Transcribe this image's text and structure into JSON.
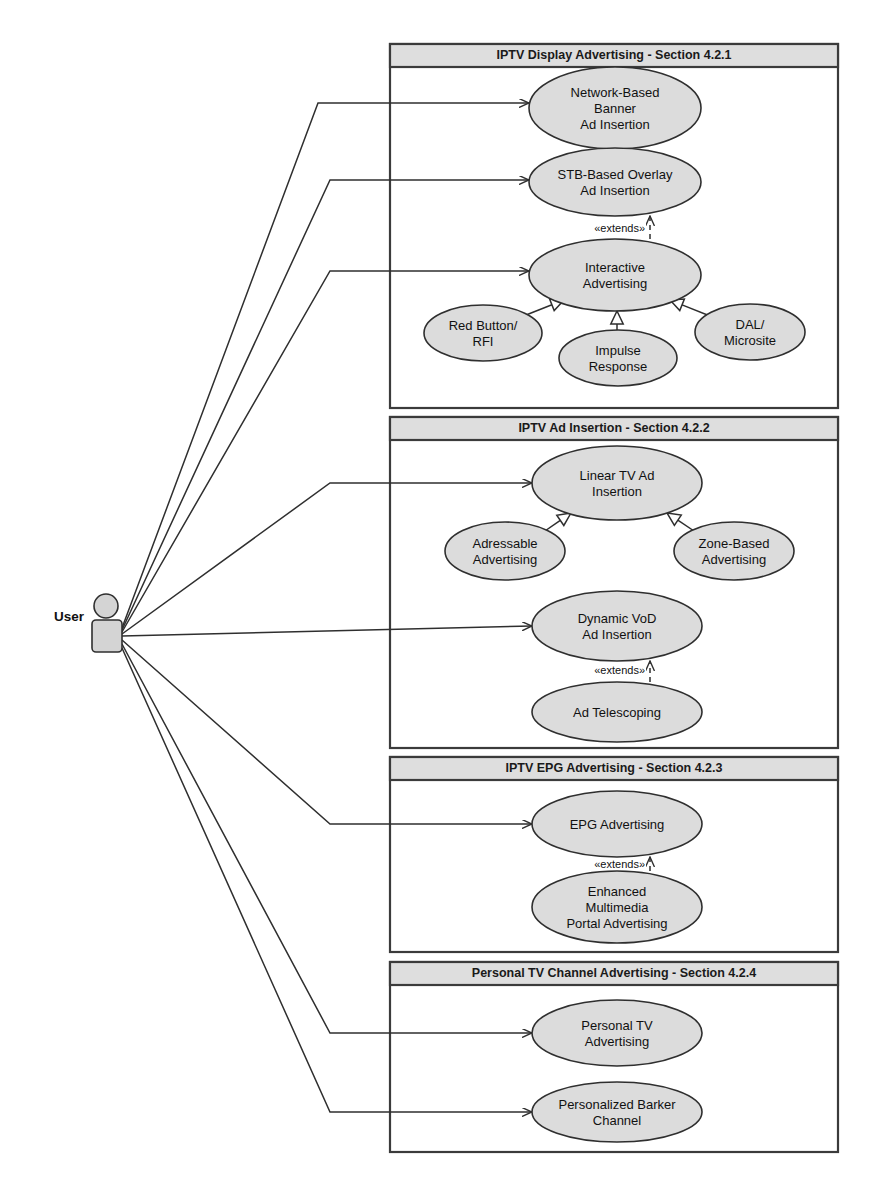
{
  "diagram": {
    "type": "uml-use-case-diagram",
    "canvas": {
      "width": 884,
      "height": 1201
    },
    "colors": {
      "ellipse_fill": "#dcdcdc",
      "ellipse_stroke": "#2f2f2f",
      "frame_header_fill": "#dedede",
      "frame_stroke": "#3b3b3b",
      "actor_fill": "#d4d4d4",
      "background": "#ffffff"
    },
    "actor": {
      "name": "User",
      "label": "User",
      "head": {
        "cx": 106,
        "cy": 606,
        "r": 12
      },
      "body": {
        "x": 92,
        "y": 620,
        "width": 30,
        "height": 32,
        "rx": 4
      },
      "label_pos": {
        "x": 84,
        "y": 617
      },
      "anchor": {
        "x": 122,
        "y": 636
      }
    },
    "stereotype_extends": "«extends»",
    "frames": [
      {
        "id": "frame-421",
        "title": "IPTV Display Advertising - Section 4.2.1",
        "x": 390,
        "y": 44,
        "width": 448,
        "height": 364,
        "header_height": 23
      },
      {
        "id": "frame-422",
        "title": "IPTV Ad Insertion - Section 4.2.2",
        "x": 390,
        "y": 417,
        "width": 448,
        "height": 331,
        "header_height": 23
      },
      {
        "id": "frame-423",
        "title": "IPTV EPG Advertising - Section 4.2.3",
        "x": 390,
        "y": 757,
        "width": 448,
        "height": 195,
        "header_height": 23
      },
      {
        "id": "frame-424",
        "title": "Personal TV Channel Advertising - Section 4.2.4",
        "x": 390,
        "y": 962,
        "width": 448,
        "height": 190,
        "header_height": 23
      }
    ],
    "use_cases": [
      {
        "id": "uc-network-banner",
        "name": "network-based-banner-ad-insertion",
        "lines": [
          "Network-Based",
          "Banner",
          "Ad Insertion"
        ],
        "cx": 615,
        "cy": 108,
        "rx": 86,
        "ry": 41,
        "frame": "frame-421"
      },
      {
        "id": "uc-stb-overlay",
        "name": "stb-based-overlay-ad-insertion",
        "lines": [
          "STB-Based Overlay",
          "Ad Insertion"
        ],
        "cx": 615,
        "cy": 182,
        "rx": 86,
        "ry": 34,
        "frame": "frame-421"
      },
      {
        "id": "uc-interactive",
        "name": "interactive-advertising",
        "lines": [
          "Interactive",
          "Advertising"
        ],
        "cx": 615,
        "cy": 275,
        "rx": 86,
        "ry": 36,
        "frame": "frame-421"
      },
      {
        "id": "uc-red-button",
        "name": "red-button-rfi",
        "lines": [
          "Red Button/",
          "RFI"
        ],
        "cx": 483,
        "cy": 333,
        "rx": 59,
        "ry": 28,
        "frame": "frame-421"
      },
      {
        "id": "uc-impulse",
        "name": "impulse-response",
        "lines": [
          "Impulse",
          "Response"
        ],
        "cx": 618,
        "cy": 358,
        "rx": 59,
        "ry": 28,
        "frame": "frame-421"
      },
      {
        "id": "uc-dal-microsite",
        "name": "dal-microsite",
        "lines": [
          "DAL/",
          "Microsite"
        ],
        "cx": 750,
        "cy": 332,
        "rx": 55,
        "ry": 28,
        "frame": "frame-421"
      },
      {
        "id": "uc-linear-tv",
        "name": "linear-tv-ad-insertion",
        "lines": [
          "Linear TV Ad",
          "Insertion"
        ],
        "cx": 617,
        "cy": 483,
        "rx": 85,
        "ry": 37,
        "frame": "frame-422"
      },
      {
        "id": "uc-addressable",
        "name": "adressable-advertising",
        "lines": [
          "Adressable",
          "Advertising"
        ],
        "cx": 505,
        "cy": 551,
        "rx": 60,
        "ry": 29,
        "frame": "frame-422"
      },
      {
        "id": "uc-zone-based",
        "name": "zone-based-advertising",
        "lines": [
          "Zone-Based",
          "Advertising"
        ],
        "cx": 734,
        "cy": 551,
        "rx": 60,
        "ry": 29,
        "frame": "frame-422"
      },
      {
        "id": "uc-dynamic-vod",
        "name": "dynamic-vod-ad-insertion",
        "lines": [
          "Dynamic VoD",
          "Ad Insertion"
        ],
        "cx": 617,
        "cy": 626,
        "rx": 85,
        "ry": 35,
        "frame": "frame-422"
      },
      {
        "id": "uc-ad-telescoping",
        "name": "ad-telescoping",
        "lines": [
          "Ad Telescoping"
        ],
        "cx": 617,
        "cy": 712,
        "rx": 85,
        "ry": 30,
        "frame": "frame-422"
      },
      {
        "id": "uc-epg-advertising",
        "name": "epg-advertising",
        "lines": [
          "EPG Advertising"
        ],
        "cx": 617,
        "cy": 824,
        "rx": 85,
        "ry": 33,
        "frame": "frame-423"
      },
      {
        "id": "uc-enhanced-portal",
        "name": "enhanced-multimedia-portal-advertising",
        "lines": [
          "Enhanced",
          "Multimedia",
          "Portal Advertising"
        ],
        "cx": 617,
        "cy": 907,
        "rx": 85,
        "ry": 36,
        "frame": "frame-423"
      },
      {
        "id": "uc-personal-tv",
        "name": "personal-tv-advertising",
        "lines": [
          "Personal TV",
          "Advertising"
        ],
        "cx": 617,
        "cy": 1033,
        "rx": 85,
        "ry": 33,
        "frame": "frame-424"
      },
      {
        "id": "uc-personalized-barker",
        "name": "personalized-barker-channel",
        "lines": [
          "Personalized Barker",
          "Channel"
        ],
        "cx": 617,
        "cy": 1112,
        "rx": 85,
        "ry": 30,
        "frame": "frame-424"
      }
    ],
    "associations": [
      {
        "id": "assoc-1",
        "name": "user-to-network-banner",
        "from": "User",
        "to": "uc-network-banner",
        "points": [
          [
            122,
            628
          ],
          [
            318,
            103
          ],
          [
            529,
            103
          ]
        ]
      },
      {
        "id": "assoc-2",
        "name": "user-to-stb-overlay",
        "from": "User",
        "to": "uc-stb-overlay",
        "points": [
          [
            122,
            630
          ],
          [
            330,
            180
          ],
          [
            529,
            180
          ]
        ]
      },
      {
        "id": "assoc-3",
        "name": "user-to-interactive",
        "from": "User",
        "to": "uc-interactive",
        "points": [
          [
            122,
            632
          ],
          [
            330,
            271
          ],
          [
            529,
            271
          ]
        ]
      },
      {
        "id": "assoc-4",
        "name": "user-to-linear-tv",
        "from": "User",
        "to": "uc-linear-tv",
        "points": [
          [
            122,
            634
          ],
          [
            330,
            483
          ],
          [
            532,
            483
          ]
        ]
      },
      {
        "id": "assoc-5",
        "name": "user-to-dynamic-vod",
        "from": "User",
        "to": "uc-dynamic-vod",
        "points": [
          [
            122,
            636
          ],
          [
            532,
            626
          ]
        ]
      },
      {
        "id": "assoc-6",
        "name": "user-to-epg-advertising",
        "from": "User",
        "to": "uc-epg-advertising",
        "points": [
          [
            122,
            640
          ],
          [
            330,
            824
          ],
          [
            532,
            824
          ]
        ]
      },
      {
        "id": "assoc-7",
        "name": "user-to-personal-tv",
        "from": "User",
        "to": "uc-personal-tv",
        "points": [
          [
            122,
            644
          ],
          [
            330,
            1033
          ],
          [
            532,
            1033
          ]
        ]
      },
      {
        "id": "assoc-8",
        "name": "user-to-personalized-barker",
        "from": "User",
        "to": "uc-personalized-barker",
        "points": [
          [
            122,
            648
          ],
          [
            330,
            1112
          ],
          [
            532,
            1112
          ]
        ]
      }
    ],
    "extends_relations": [
      {
        "id": "ext-1",
        "name": "interactive-extends-stb-overlay",
        "from": "uc-interactive",
        "to": "uc-stb-overlay",
        "x": 650,
        "y1": 239,
        "y2": 216,
        "label_x": 645,
        "label_y": 232
      },
      {
        "id": "ext-2",
        "name": "ad-telescoping-extends-dynamic-vod",
        "from": "uc-ad-telescoping",
        "to": "uc-dynamic-vod",
        "x": 650,
        "y1": 682,
        "y2": 661,
        "label_x": 645,
        "label_y": 674
      },
      {
        "id": "ext-3",
        "name": "enhanced-portal-extends-epg-advertising",
        "from": "uc-enhanced-portal",
        "to": "uc-epg-advertising",
        "x": 650,
        "y1": 871,
        "y2": 857,
        "label_x": 645,
        "label_y": 868
      }
    ],
    "generalizations": [
      {
        "id": "gen-1",
        "name": "red-button-generalizes-interactive",
        "from": "uc-red-button",
        "to": "uc-interactive",
        "x1": 521,
        "y1": 317,
        "x2": 564,
        "y2": 300
      },
      {
        "id": "gen-2",
        "name": "impulse-response-generalizes-interactive",
        "from": "uc-impulse",
        "to": "uc-interactive",
        "x1": 617,
        "y1": 330,
        "x2": 617,
        "y2": 311
      },
      {
        "id": "gen-3",
        "name": "dal-microsite-generalizes-interactive",
        "from": "uc-dal-microsite",
        "to": "uc-interactive",
        "x1": 710,
        "y1": 316,
        "x2": 670,
        "y2": 300
      },
      {
        "id": "gen-4",
        "name": "adressable-generalizes-linear-tv",
        "from": "uc-addressable",
        "to": "uc-linear-tv",
        "x1": 542,
        "y1": 533,
        "x2": 571,
        "y2": 513
      },
      {
        "id": "gen-5",
        "name": "zone-based-generalizes-linear-tv",
        "from": "uc-zone-based",
        "to": "uc-linear-tv",
        "x1": 697,
        "y1": 533,
        "x2": 667,
        "y2": 513
      }
    ]
  }
}
